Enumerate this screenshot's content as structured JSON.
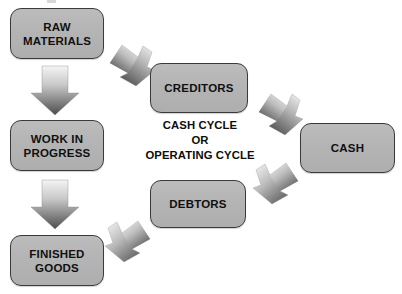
{
  "diagram": {
    "center_caption": {
      "line1": "CASH CYCLE",
      "line2": "OR",
      "line3": "OPERATING CYCLE"
    },
    "nodes": [
      {
        "id": "raw",
        "label": "RAW\nMATERIALS"
      },
      {
        "id": "wip",
        "label": "WORK IN\nPROGRESS"
      },
      {
        "id": "finished",
        "label": "FINISHED\nGOODS"
      },
      {
        "id": "creditors",
        "label": "CREDITORS"
      },
      {
        "id": "debtors",
        "label": "DEBTORS"
      },
      {
        "id": "cash",
        "label": "CASH"
      }
    ],
    "arrows": [
      {
        "id": "raw-to-wip",
        "direction": "down",
        "from": "RAW MATERIALS",
        "to": "WORK IN PROGRESS"
      },
      {
        "id": "wip-to-finished",
        "direction": "down",
        "from": "WORK IN PROGRESS",
        "to": "FINISHED GOODS"
      },
      {
        "id": "creditors-to-raw",
        "direction": "upper-left",
        "from": "CREDITORS",
        "to": "RAW MATERIALS"
      },
      {
        "id": "finished-to-debtors",
        "direction": "upper-right",
        "from": "FINISHED GOODS",
        "to": "DEBTORS"
      },
      {
        "id": "cash-to-creditors",
        "direction": "upper-left",
        "from": "CASH",
        "to": "CREDITORS"
      },
      {
        "id": "debtors-to-cash",
        "direction": "upper-right",
        "from": "DEBTORS",
        "to": "CASH"
      }
    ],
    "colors": {
      "box_fill": "#b4b4b4",
      "box_border": "#3a3a3a",
      "arrow_light": "#f2f2f2",
      "arrow_dark": "#4a4a4a",
      "text": "#101010",
      "background": "#ffffff"
    }
  }
}
